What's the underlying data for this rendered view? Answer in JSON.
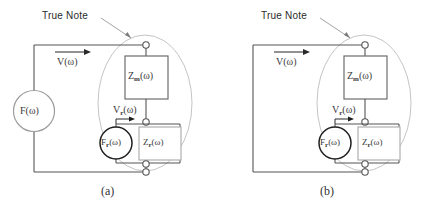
{
  "figure": {
    "panels": [
      {
        "id": "a",
        "caption": "(a)",
        "annotation": "True Note",
        "has_source": true,
        "source_label": "F(ω)",
        "line_label": "V(ω)",
        "node_label": "V",
        "node_label_sub": "r",
        "node_label_tail": "(ω)",
        "impedance_main": "Z",
        "impedance_main_sub": "m",
        "impedance_main_tail": "(ω)",
        "inner_source": "F",
        "inner_source_sub": "r",
        "inner_source_tail": "(ω)",
        "impedance_inner": "Z",
        "impedance_inner_sub": "r",
        "impedance_inner_tail": "(ω)"
      },
      {
        "id": "b",
        "caption": "(b)",
        "annotation": "True Note",
        "has_source": false,
        "source_label": "",
        "line_label": "V(ω)",
        "node_label": "V",
        "node_label_sub": "r",
        "node_label_tail": "(ω)",
        "impedance_main": "Z",
        "impedance_main_sub": "m",
        "impedance_main_tail": "(ω)",
        "inner_source": "F",
        "inner_source_sub": "r",
        "inner_source_tail": "(ω)",
        "impedance_inner": "Z",
        "impedance_inner_sub": "r",
        "impedance_inner_tail": "(ω)"
      }
    ],
    "colors": {
      "wire": "#4a4a4a",
      "ellipse": "#b9b9b9",
      "box": "#6d6d6d",
      "box_light": "#b0b0b0",
      "source_dark": "#1c1c1c",
      "source_light": "#9a9a9a",
      "text": "#333333",
      "background": "#ffffff"
    }
  }
}
